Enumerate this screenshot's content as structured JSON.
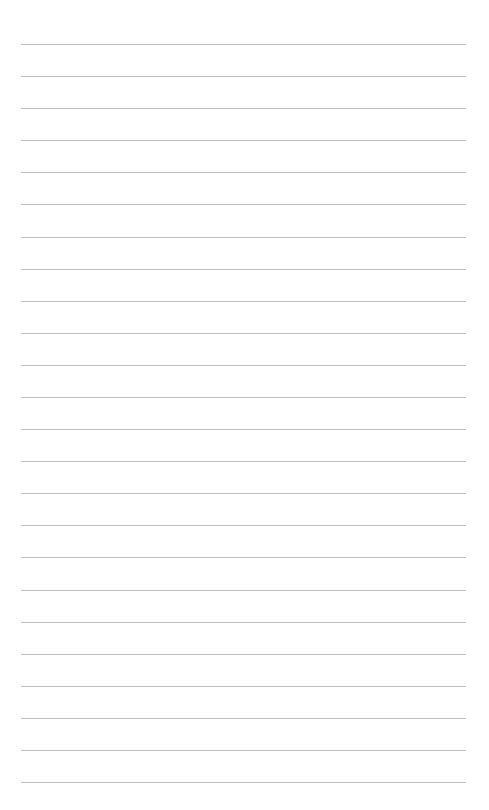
{
  "page": {
    "type": "lined-paper",
    "background": "#ffffff",
    "line_color": "#bdbdbd",
    "line_count": 24,
    "first_line_y": 44,
    "line_spacing": 32.09,
    "line_left": 21,
    "line_width": 445
  }
}
